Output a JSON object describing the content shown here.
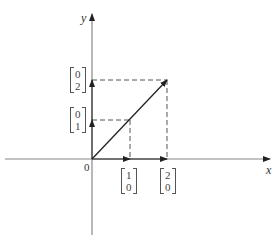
{
  "diagram": {
    "axes": {
      "x_label": "x",
      "y_label": "y",
      "origin_label": "0"
    },
    "vectors": {
      "e1": {
        "top": "1",
        "bottom": "0"
      },
      "e1x2": {
        "top": "2",
        "bottom": "0"
      },
      "e2": {
        "top": "0",
        "bottom": "1"
      },
      "e2x2": {
        "top": "0",
        "bottom": "2"
      }
    },
    "main_vector": {
      "from": [
        0,
        0
      ],
      "to": [
        2,
        2
      ]
    },
    "colors": {
      "axis": "#777777",
      "vector": "#222222",
      "dashed": "#555555"
    }
  }
}
